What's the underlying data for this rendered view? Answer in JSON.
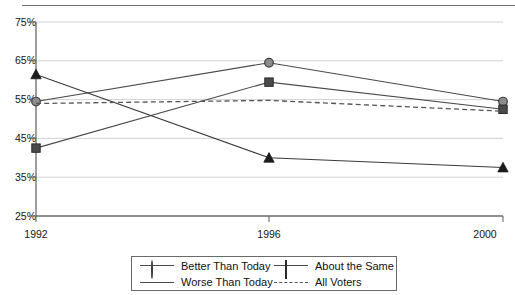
{
  "chart_data": {
    "type": "line",
    "title": "",
    "subtitle": "",
    "xlabel": "",
    "ylabel": "",
    "x": [
      "1992",
      "1996",
      "2000"
    ],
    "categories": [
      "1992",
      "1996",
      "2000"
    ],
    "xtick_labels": [
      "1992",
      "1996",
      "2000"
    ],
    "ytick_labels": [
      "75%",
      "65%",
      "55%",
      "45%",
      "35%",
      "25%"
    ],
    "ytick_values": [
      75,
      65,
      55,
      45,
      35,
      25
    ],
    "ylim": [
      25,
      75
    ],
    "yunit": "%",
    "grid": "horizontal",
    "legend_position": "bottom",
    "series": [
      {
        "name": "Better Than Today",
        "marker": "circle",
        "linestyle": "solid",
        "color": "#4a4a4a",
        "marker_fill": "#8d8d8d",
        "values": [
          54.5,
          64.5,
          54.5
        ]
      },
      {
        "name": "About the Same",
        "marker": "square",
        "linestyle": "solid",
        "color": "#4a4a4a",
        "marker_fill": "#4a4a4a",
        "values": [
          42.5,
          59.5,
          52.5
        ]
      },
      {
        "name": "Worse Than Today",
        "marker": "triangle",
        "linestyle": "solid",
        "color": "#3a3a3a",
        "marker_fill": "#1c1c1c",
        "values": [
          61.5,
          40.0,
          37.5
        ]
      },
      {
        "name": "All Voters",
        "marker": "none",
        "linestyle": "dashed",
        "color": "#555555",
        "marker_fill": "none",
        "values": [
          54.0,
          54.8,
          52.0
        ]
      }
    ]
  },
  "axes": {
    "y_labels": [
      "75%",
      "65%",
      "55%",
      "45%",
      "35%",
      "25%"
    ],
    "x_labels": [
      "1992",
      "1996",
      "2000"
    ]
  },
  "legend": {
    "items": [
      {
        "label": "Better Than Today",
        "marker": "circle-marker",
        "linestyle": "solid"
      },
      {
        "label": "About the Same",
        "marker": "square-marker",
        "linestyle": "solid"
      },
      {
        "label": "Worse Than Today",
        "marker": "triangle-marker",
        "linestyle": "solid"
      },
      {
        "label": "All Voters",
        "marker": "none",
        "linestyle": "dashed"
      }
    ]
  },
  "colors": {
    "grid": "#d2d2d2",
    "axis": "#6a6a6a",
    "series_line": "#4a4a4a",
    "text": "#141414",
    "top_rule": "#6e6e6e",
    "background": "#ffffff"
  }
}
